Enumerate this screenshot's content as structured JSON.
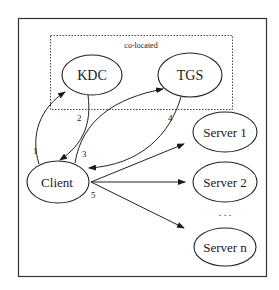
{
  "diagram": {
    "group_label": "co-located",
    "nodes": {
      "kdc": "KDC",
      "tgs": "TGS",
      "client": "Client",
      "server1": "Server 1",
      "server2": "Server 2",
      "servern": "Server n"
    },
    "ellipsis": ". . .",
    "edges": [
      {
        "label": "1",
        "from": "Client",
        "to": "KDC"
      },
      {
        "label": "2",
        "from": "KDC",
        "to": "Client"
      },
      {
        "label": "3",
        "from": "Client",
        "to": "TGS"
      },
      {
        "label": "4",
        "from": "TGS",
        "to": "Client"
      },
      {
        "label": "5",
        "from": "Client",
        "to": "Servers"
      }
    ]
  }
}
